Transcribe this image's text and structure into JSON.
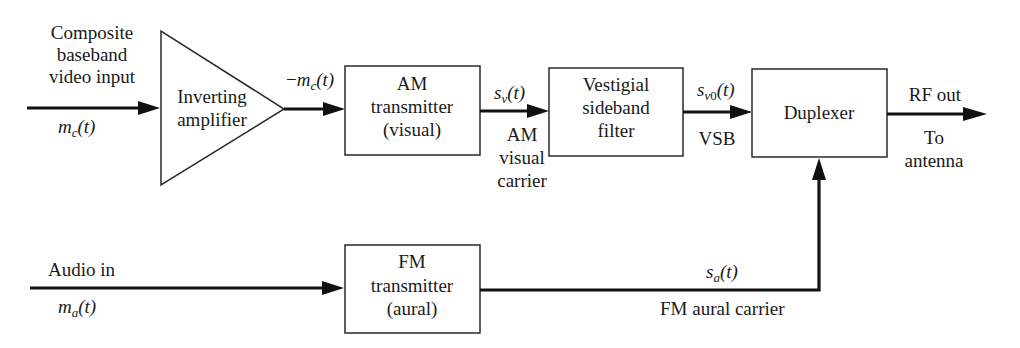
{
  "diagram": {
    "type": "block-diagram"
  },
  "inputs": {
    "video": {
      "label_lines": [
        "Composite",
        "baseband",
        "video input"
      ],
      "signal": {
        "base": "m",
        "sub": "c",
        "arg": "(t)"
      }
    },
    "audio": {
      "label": "Audio in",
      "signal": {
        "base": "m",
        "sub": "a",
        "arg": "(t)"
      }
    }
  },
  "blocks": {
    "inverting_amplifier": {
      "lines": [
        "Inverting",
        "amplifier"
      ]
    },
    "am_transmitter": {
      "lines": [
        "AM",
        "transmitter",
        "(visual)"
      ]
    },
    "vsb_filter": {
      "lines": [
        "Vestigial",
        "sideband",
        "filter"
      ]
    },
    "duplexer": {
      "lines": [
        "Duplexer"
      ]
    },
    "fm_transmitter": {
      "lines": [
        "FM",
        "transmitter",
        "(aural)"
      ]
    }
  },
  "signals": {
    "inverted": {
      "prefix": "−",
      "base": "m",
      "sub": "c",
      "arg": "(t)"
    },
    "sv": {
      "base": "s",
      "sub": "v",
      "arg": "(t)",
      "caption_lines": [
        "AM",
        "visual",
        "carrier"
      ]
    },
    "sv0": {
      "base": "s",
      "sub": "v",
      "sub2": "0",
      "arg": "(t)",
      "caption": "VSB"
    },
    "sa": {
      "base": "s",
      "sub": "a",
      "arg": "(t)",
      "caption": "FM aural carrier"
    },
    "rf": {
      "label": "RF out",
      "caption_lines": [
        "To",
        "antenna"
      ]
    }
  }
}
